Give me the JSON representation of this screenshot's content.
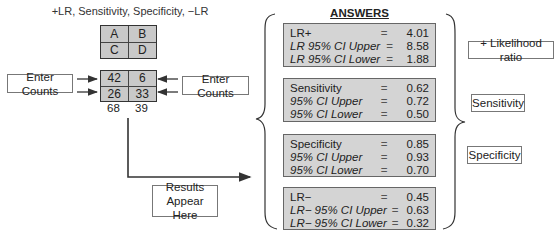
{
  "subtitle": "+LR, Sensitivity, Specificity, −LR",
  "template_grid": {
    "cells": [
      "A",
      "B",
      "C",
      "D"
    ]
  },
  "counts_grid": {
    "cells": [
      "42",
      "6",
      "26",
      "33"
    ],
    "column_totals": [
      "68",
      "39"
    ]
  },
  "inputs": {
    "left_label": "Enter Counts",
    "right_label": "Enter Counts"
  },
  "results_label": {
    "line1": "Results",
    "line2": "Appear Here"
  },
  "answers": {
    "title": "ANSWERS",
    "groups": [
      {
        "rows": [
          {
            "label": "LR+",
            "eq": "=",
            "value": "4.01"
          },
          {
            "label": "LR 95% CI Upper",
            "eq": "=",
            "value": "8.58"
          },
          {
            "label": "LR 95% CI Lower",
            "eq": "=",
            "value": "1.88"
          }
        ]
      },
      {
        "rows": [
          {
            "label": "Sensitivity",
            "eq": "=",
            "value": "0.62"
          },
          {
            "label": "95% CI Upper",
            "eq": "=",
            "value": "0.72"
          },
          {
            "label": "95% CI Lower",
            "eq": "=",
            "value": "0.50"
          }
        ]
      },
      {
        "rows": [
          {
            "label": "Specificity",
            "eq": "=",
            "value": "0.85"
          },
          {
            "label": "95% CI Upper",
            "eq": "=",
            "value": "0.93"
          },
          {
            "label": "95% CI Lower",
            "eq": "=",
            "value": "0.70"
          }
        ]
      },
      {
        "rows": [
          {
            "label": "LR−",
            "eq": "=",
            "value": "0.45"
          },
          {
            "label": "LR− 95% CI Upper",
            "eq": "=",
            "value": "0.63"
          },
          {
            "label": "LR− 95% CI Lower",
            "eq": "=",
            "value": "0.32"
          }
        ]
      }
    ]
  },
  "side_labels": {
    "plus_lr": "+ Likelihood ratio",
    "sensitivity": "Sensitivity",
    "specificity": "Specificity"
  }
}
